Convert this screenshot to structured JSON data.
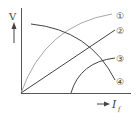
{
  "diagram": {
    "y_axis_label": "V",
    "x_axis_label": "I",
    "x_axis_subscript": "f",
    "curves": [
      {
        "id": "1",
        "label": "①",
        "color": "#9a9a9a",
        "shape": "rising concave from origin"
      },
      {
        "id": "2",
        "label": "②",
        "color": "#444444",
        "shape": "straight line from origin"
      },
      {
        "id": "3",
        "label": "③",
        "color": "#444444",
        "shape": "rising from offset on x axis"
      },
      {
        "id": "4",
        "label": "④",
        "color": "#444444",
        "shape": "falling curve"
      }
    ]
  }
}
